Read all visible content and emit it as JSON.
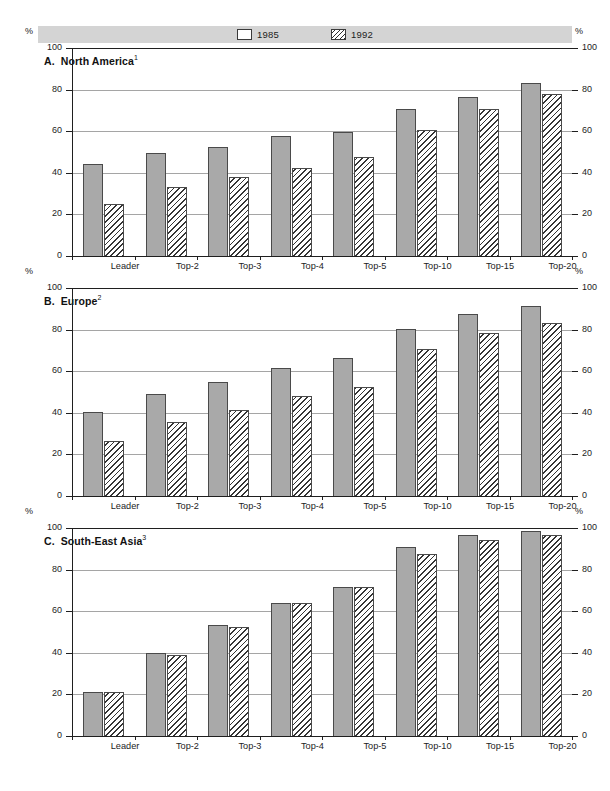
{
  "legend": {
    "entries": [
      {
        "label": "1985",
        "pattern": "solid-gray"
      },
      {
        "label": "1992",
        "pattern": "diagonal-hatch"
      }
    ]
  },
  "axis": {
    "unit_label": "%",
    "ticks": [
      "100",
      "80",
      "60",
      "40",
      "20",
      "0"
    ]
  },
  "panels": [
    {
      "id": "a",
      "letter": "A.",
      "name": "North America",
      "footnote": "1"
    },
    {
      "id": "b",
      "letter": "B.",
      "name": "Europe",
      "footnote": "2"
    },
    {
      "id": "c",
      "letter": "C.",
      "name": "South-East Asia",
      "footnote": "3"
    }
  ],
  "chart_data": [
    {
      "type": "bar",
      "title": "A.  North America",
      "xlabel": "",
      "ylabel": "%",
      "ylim": [
        0,
        100
      ],
      "yticks": [
        0,
        20,
        40,
        60,
        80,
        100
      ],
      "grid": true,
      "legend_position": "top-center",
      "categories": [
        "Leader",
        "Top-2",
        "Top-3",
        "Top-4",
        "Top-5",
        "Top-10",
        "Top-15",
        "Top-20"
      ],
      "series": [
        {
          "name": "1985",
          "values": [
            44,
            49.5,
            52.5,
            57.5,
            59.5,
            70.5,
            76.5,
            83
          ]
        },
        {
          "name": "1992",
          "values": [
            25,
            33,
            38,
            42.5,
            47.5,
            60.5,
            70.5,
            78
          ]
        }
      ]
    },
    {
      "type": "bar",
      "title": "B.  Europe",
      "xlabel": "",
      "ylabel": "%",
      "ylim": [
        0,
        100
      ],
      "yticks": [
        0,
        20,
        40,
        60,
        80,
        100
      ],
      "grid": true,
      "legend_position": "top-center",
      "categories": [
        "Leader",
        "Top-2",
        "Top-3",
        "Top-4",
        "Top-5",
        "Top-10",
        "Top-15",
        "Top-20"
      ],
      "series": [
        {
          "name": "1985",
          "values": [
            40.5,
            49,
            55,
            61.5,
            66.5,
            80.5,
            87.5,
            91.5
          ]
        },
        {
          "name": "1992",
          "values": [
            26.5,
            35.5,
            41.5,
            48,
            52.5,
            70.5,
            78.5,
            83
          ]
        }
      ]
    },
    {
      "type": "bar",
      "title": "C.  South-East Asia",
      "xlabel": "",
      "ylabel": "%",
      "ylim": [
        0,
        100
      ],
      "yticks": [
        0,
        20,
        40,
        60,
        80,
        100
      ],
      "grid": true,
      "legend_position": "top-center",
      "categories": [
        "Leader",
        "Top-2",
        "Top-3",
        "Top-4",
        "Top-5",
        "Top-10",
        "Top-15",
        "Top-20"
      ],
      "series": [
        {
          "name": "1985",
          "values": [
            21,
            40,
            53.5,
            64,
            71.5,
            91,
            96.5,
            98.5
          ]
        },
        {
          "name": "1992",
          "values": [
            21,
            39,
            52.5,
            64,
            71.5,
            87.5,
            94,
            96.5
          ]
        }
      ]
    }
  ]
}
